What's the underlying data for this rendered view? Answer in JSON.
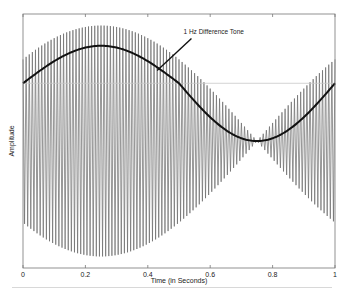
{
  "chart_data": {
    "type": "line",
    "title": "",
    "xlabel": "Time (in Seconds)",
    "ylabel": "Amplitude",
    "xlim": [
      0,
      1
    ],
    "ylim": [
      -2.2,
      2.2
    ],
    "xticks": [
      0,
      0.2,
      0.4,
      0.6,
      0.8,
      1
    ],
    "xtick_labels": [
      "0",
      "0.2",
      "0.4",
      "0.6",
      "0.8",
      "1"
    ],
    "yticks_visible": false,
    "grid": false,
    "series": [
      {
        "name": "Beating signal (sum of two tones)",
        "style": "thin gray oscillation",
        "carrier_cycles": 100,
        "envelope_peak_time": 0.25,
        "envelope_null_time": 0.75,
        "peak_amplitude": 2.0,
        "color": "#6a6a6a"
      },
      {
        "name": "1 Hz Difference Tone",
        "style": "thick black curve",
        "x": [
          0,
          0.1,
          0.2,
          0.25,
          0.3,
          0.4,
          0.5,
          0.6,
          0.7,
          0.75,
          0.8,
          0.9,
          1.0
        ],
        "y": [
          1.0,
          1.31,
          1.59,
          1.65,
          1.59,
          1.31,
          1.0,
          0.49,
          0.1,
          0.0,
          0.1,
          0.49,
          1.0
        ],
        "color": "#111111"
      }
    ],
    "reference_line": {
      "y": 1.0,
      "color": "#c8c8c8"
    },
    "annotations": [
      {
        "text": "1 Hz Difference Tone",
        "x_text": 0.54,
        "y_text": 1.95,
        "arrow_to_x": 0.43,
        "arrow_to_y": 1.22
      }
    ]
  }
}
